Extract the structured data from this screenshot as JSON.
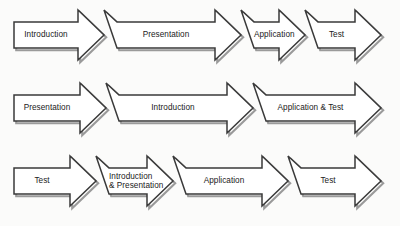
{
  "diagram": {
    "background_color": "#fbfbfa",
    "outline_color": "#3a3a3a",
    "fill_color": "#ffffff",
    "shadow_color": "#9a9a9a",
    "text_color": "#1a1a1a",
    "rows": [
      {
        "name": "row-1",
        "segments": [
          {
            "label": "Introduction",
            "lines": [
              "Introduction"
            ]
          },
          {
            "label": "Presentation",
            "lines": [
              "Presentation"
            ]
          },
          {
            "label": "Application",
            "lines": [
              "Application"
            ]
          },
          {
            "label": "Test",
            "lines": [
              "Test"
            ]
          }
        ]
      },
      {
        "name": "row-2",
        "segments": [
          {
            "label": "Presentation",
            "lines": [
              "Presentation"
            ]
          },
          {
            "label": "Introduction",
            "lines": [
              "Introduction"
            ]
          },
          {
            "label": "Application & Test",
            "lines": [
              "Application & Test"
            ]
          }
        ]
      },
      {
        "name": "row-3",
        "segments": [
          {
            "label": "Test",
            "lines": [
              "Test"
            ]
          },
          {
            "label": "Introduction & Presentation",
            "lines": [
              "Introduction",
              "& Presentation"
            ]
          },
          {
            "label": "Application",
            "lines": [
              "Application"
            ]
          },
          {
            "label": "Test",
            "lines": [
              "Test"
            ]
          }
        ]
      }
    ]
  },
  "geometry": {
    "rows": [
      {
        "top": 13,
        "body_top": 22,
        "body_bottom": 48,
        "head_top": 10,
        "head_bottom": 60,
        "x_start": 14,
        "x_end": 381,
        "boundaries": [
          104,
          241,
          305
        ],
        "notched": [
          false,
          true,
          true,
          true
        ]
      },
      {
        "top": 86,
        "body_top": 95,
        "body_bottom": 121,
        "head_top": 83,
        "head_bottom": 133,
        "x_start": 14,
        "x_end": 381,
        "boundaries": [
          106,
          253
        ],
        "notched": [
          false,
          true,
          true
        ]
      },
      {
        "top": 159,
        "body_top": 168,
        "body_bottom": 194,
        "head_top": 156,
        "head_bottom": 206,
        "x_start": 14,
        "x_end": 381,
        "boundaries": [
          96,
          173,
          288
        ],
        "notched": [
          false,
          true,
          true,
          true
        ]
      }
    ],
    "head_length": 26,
    "notch_depth": 13
  }
}
